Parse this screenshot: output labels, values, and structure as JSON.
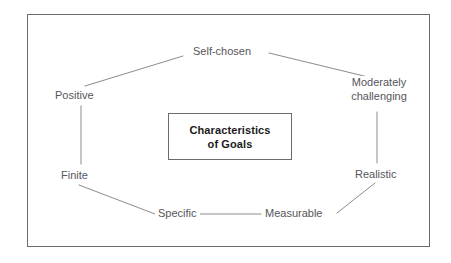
{
  "diagram": {
    "title": "Characteristics of Goals",
    "center": {
      "name": "center-box",
      "line1": "Characteristics",
      "line2": "of Goals"
    },
    "nodes": [
      {
        "id": "self-chosen",
        "label": "Self-chosen",
        "position": "top-center"
      },
      {
        "id": "moderately-challenging",
        "label_line1": "Moderately",
        "label_line2": "challenging",
        "position": "upper-right"
      },
      {
        "id": "realistic",
        "label": "Realistic",
        "position": "lower-right"
      },
      {
        "id": "measurable",
        "label": "Measurable",
        "position": "bottom-right"
      },
      {
        "id": "specific",
        "label": "Specific",
        "position": "bottom-left"
      },
      {
        "id": "finite",
        "label": "Finite",
        "position": "lower-left"
      },
      {
        "id": "positive",
        "label": "Positive",
        "position": "upper-left"
      }
    ],
    "connectors": [
      {
        "from": "positive",
        "to": "self-chosen"
      },
      {
        "from": "self-chosen",
        "to": "moderately-challenging"
      },
      {
        "from": "moderately-challenging",
        "to": "realistic"
      },
      {
        "from": "realistic",
        "to": "measurable"
      },
      {
        "from": "measurable",
        "to": "specific"
      },
      {
        "from": "specific",
        "to": "finite"
      },
      {
        "from": "finite",
        "to": "positive"
      }
    ],
    "colors": {
      "line": "#8c8c8c",
      "frame": "#6b6b6b",
      "label_text": "#55565a",
      "center_text": "#1b1b1b",
      "background": "#ffffff"
    }
  }
}
